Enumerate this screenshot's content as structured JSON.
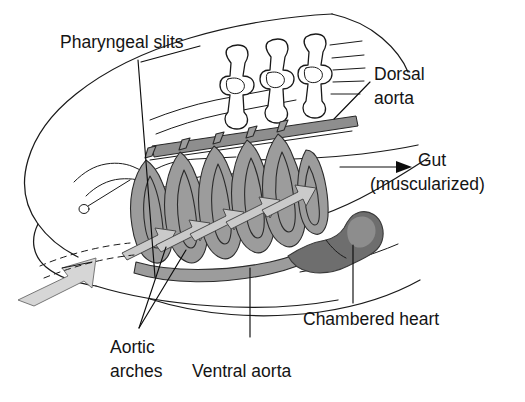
{
  "figure": {
    "background_color": "#ffffff",
    "ink_color": "#1a1a1a",
    "vessel_gray": "#9c9c9c",
    "arrow_gray": "#cacaca",
    "heart_gray": "#6f6f6f"
  },
  "labels": {
    "pharyngeal_slits": "Pharyngeal slits",
    "dorsal_aorta_line1": "Dorsal",
    "dorsal_aorta_line2": "aorta",
    "gut_line1": "Gut",
    "gut_line2": "(muscularized)",
    "chambered_heart": "Chambered heart",
    "aortic_arches_line1": "Aortic",
    "aortic_arches_line2": "arches",
    "ventral_aorta": "Ventral aorta"
  },
  "structures": {
    "aortic_arch_count": 6,
    "flow_arrow_count": 5,
    "pharyngeal_slit_bar_count": 3,
    "inflow_arrow": "water-blood-inflow"
  }
}
